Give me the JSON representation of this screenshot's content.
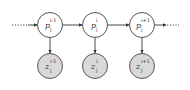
{
  "diagram": {
    "type": "chain-graphical-model",
    "colors": {
      "stroke": "#555555",
      "observed_fill": "#d9d9d9",
      "latent_fill": "#ffffff"
    },
    "top_nodes": [
      {
        "base": "p",
        "sup": "i-1",
        "sub": "j"
      },
      {
        "base": "p",
        "sup": "i",
        "sub": "j"
      },
      {
        "base": "p",
        "sup": "i+1",
        "sub": "j"
      }
    ],
    "bottom_nodes": [
      {
        "base": "z",
        "sup": "i-1",
        "sub": "j"
      },
      {
        "base": "z",
        "sup": "i",
        "sub": "j"
      },
      {
        "base": "z",
        "sup": "i+1",
        "sub": "j"
      }
    ],
    "edges": [
      {
        "from": "start",
        "to": "top-0",
        "style": "dotted"
      },
      {
        "from": "top-0",
        "to": "top-1"
      },
      {
        "from": "top-1",
        "to": "top-2"
      },
      {
        "from": "top-2",
        "to": "end",
        "style": "dotted"
      },
      {
        "from": "top-0",
        "to": "bottom-0"
      },
      {
        "from": "top-1",
        "to": "bottom-1"
      },
      {
        "from": "top-2",
        "to": "bottom-2"
      }
    ]
  }
}
